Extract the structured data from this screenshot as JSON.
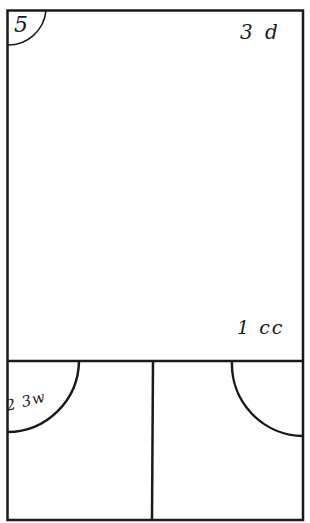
{
  "diagram": {
    "type": "floor-plan-sketch",
    "stroke_color": "#1a1a1a",
    "background_color": "#ffffff",
    "rooms": [
      {
        "id": "main-room",
        "label": "3 d"
      },
      {
        "id": "bottom-left-room",
        "label": "2 3w"
      },
      {
        "id": "bottom-right-room",
        "label": ""
      }
    ],
    "labels": {
      "corner_number": "5",
      "top_right": "3 d",
      "main_bottom_right": "1 cc",
      "bottom_left_arc": "2 3w"
    },
    "door_swings": [
      {
        "room": "main-room",
        "corner": "top-left"
      },
      {
        "room": "bottom-left-room",
        "corner": "top-left"
      },
      {
        "room": "bottom-right-room",
        "corner": "top-right"
      }
    ]
  }
}
